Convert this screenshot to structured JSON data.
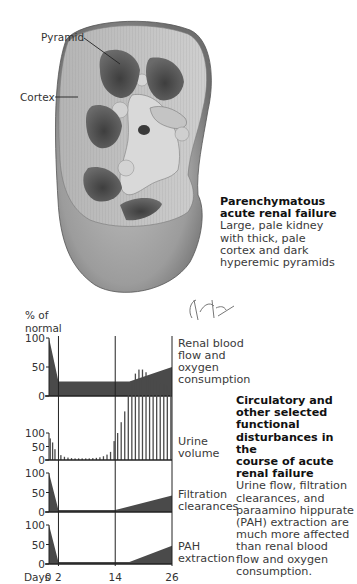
{
  "illustration": {
    "labels": {
      "pyramid": "Pyramid",
      "cortex": "Cortex"
    },
    "signature": "F. Netter M.D.",
    "caption_top": {
      "title_line1": "Parenchymatous",
      "title_line2": "acute renal failure",
      "body_line1": "Large, pale kidney",
      "body_line2": "with thick, pale",
      "body_line3": "cortex and dark",
      "body_line4": "hyperemic pyramids"
    },
    "caption_bottom": {
      "title_line1": "Circulatory and",
      "title_line2": "other selected",
      "title_line3": "functional",
      "title_line4": "disturbances in the",
      "title_line5": "course of acute",
      "title_line6": "renal failure",
      "body_line1": "Urine flow, filtration",
      "body_line2": "clearances, and",
      "body_line3": "paraamino hippurate",
      "body_line4": "(PAH) extraction are",
      "body_line5": "much more affected",
      "body_line6": "than renal blood",
      "body_line7": "flow and oxygen",
      "body_line8": "consumption."
    },
    "colors": {
      "fill_dark": "#4a4a4a",
      "kidney_light": "#c8c8c8",
      "kidney_mid": "#9a9a9a",
      "kidney_dark": "#5a5a5a"
    }
  },
  "chart_data": {
    "type": "area",
    "title": "Circulatory and other selected functional disturbances in the course of acute renal failure",
    "ylabel_line1": "% of",
    "ylabel_line2": "normal",
    "xlabel": "Days",
    "x_ticks": [
      "0",
      "2",
      "14",
      "26"
    ],
    "x_tick_values": [
      0,
      2,
      14,
      26
    ],
    "vertical_gridlines_at_days": [
      2,
      14,
      26
    ],
    "panels": [
      {
        "name": "Renal blood flow and oxygen consumption",
        "label_line1": "Renal blood",
        "label_line2": "flow and",
        "label_line3": "oxygen",
        "label_line4": "consumption",
        "y_ticks": [
          "100",
          "50",
          "0"
        ],
        "ylim": [
          0,
          100
        ],
        "type": "area",
        "x": [
          0,
          2,
          14,
          17,
          26
        ],
        "y": [
          100,
          25,
          25,
          25,
          50
        ]
      },
      {
        "name": "Urine volume",
        "label_line1": "Urine",
        "label_line2": "volume",
        "y_ticks": [
          "100",
          "50",
          "0"
        ],
        "ylim": [
          0,
          100
        ],
        "type": "bar",
        "x": [
          0.25,
          0.75,
          1.25,
          2.5,
          3.25,
          4,
          4.75,
          5.5,
          6.25,
          7,
          7.75,
          8.5,
          9.25,
          10,
          10.75,
          11.5,
          12.25,
          13,
          13.75,
          14.5,
          15.25,
          16,
          16.75,
          17.5,
          18.25,
          19,
          19.75,
          20.5,
          21.25,
          22,
          22.75,
          23.5,
          24.25,
          25,
          25.75
        ],
        "y": [
          80,
          65,
          40,
          18,
          12,
          9,
          7,
          6,
          6,
          6,
          6,
          6,
          7,
          8,
          10,
          14,
          20,
          30,
          70,
          100,
          140,
          180,
          240,
          290,
          320,
          335,
          335,
          325,
          310,
          300,
          290,
          285,
          280,
          275,
          270
        ]
      },
      {
        "name": "Filtration clearances",
        "label_line1": "Filtration",
        "label_line2": "clearances",
        "y_ticks": [
          "100",
          "50",
          "0"
        ],
        "ylim": [
          0,
          100
        ],
        "type": "area",
        "x": [
          0,
          2,
          14,
          26
        ],
        "y": [
          100,
          5,
          5,
          42
        ]
      },
      {
        "name": "PAH extraction",
        "label_line1": "PAH",
        "label_line2": "extraction",
        "y_ticks": [
          "100",
          "50",
          "0"
        ],
        "ylim": [
          0,
          100
        ],
        "type": "area",
        "x": [
          0,
          2,
          14,
          17,
          26
        ],
        "y": [
          100,
          5,
          5,
          5,
          47
        ]
      }
    ]
  }
}
